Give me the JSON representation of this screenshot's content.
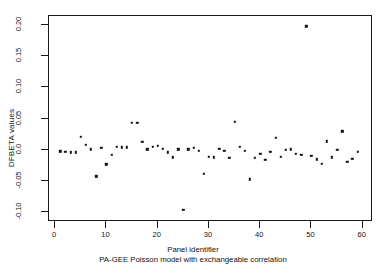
{
  "chart_data": {
    "type": "scatter",
    "title": "",
    "xlabel": "Panel identifier",
    "ylabel": "DFBETA values",
    "caption": "PA-GEE Poisson model with exchangeable correlation",
    "xlim": [
      -1.2,
      62.0
    ],
    "ylim": [
      -0.1155,
      0.2145
    ],
    "xticks": [
      0,
      10,
      20,
      30,
      40,
      50,
      60
    ],
    "xtick_labels": [
      "0",
      "10",
      "20",
      "30",
      "40",
      "50",
      "60"
    ],
    "yticks": [
      0.2,
      0.15,
      0.1,
      0.05,
      0.0,
      -0.05,
      -0.1
    ],
    "ytick_labels": [
      "0.20",
      "0.15",
      "0.10",
      "0.05",
      "0.0",
      "-0.05",
      "-0.10"
    ],
    "grid": false,
    "legend": null,
    "marker": "filled-square",
    "marker_color": "#111111",
    "x": [
      1,
      2,
      3,
      4,
      5,
      6,
      7,
      8,
      9,
      10,
      11,
      12,
      13,
      14,
      15,
      16,
      17,
      18,
      19,
      20,
      21,
      22,
      23,
      24,
      25,
      26,
      27,
      28,
      29,
      30,
      31,
      32,
      33,
      34,
      35,
      36,
      37,
      38,
      39,
      40,
      41,
      42,
      43,
      44,
      45,
      46,
      47,
      48,
      49,
      50,
      51,
      52,
      53,
      54,
      55,
      56,
      57,
      58,
      59
    ],
    "y": [
      -0.002,
      -0.003,
      -0.004,
      -0.004,
      0.021,
      0.008,
      0.001,
      -0.042,
      0.003,
      -0.023,
      -0.008,
      0.005,
      0.004,
      0.004,
      0.043,
      0.043,
      0.013,
      0.001,
      0.005,
      0.007,
      0.002,
      -0.004,
      -0.012,
      0.001,
      -0.096,
      0.001,
      0.003,
      -0.001,
      -0.038,
      -0.011,
      -0.012,
      0.002,
      -0.001,
      -0.013,
      0.045,
      0.005,
      -0.001,
      -0.047,
      -0.013,
      -0.006,
      -0.016,
      -0.003,
      0.019,
      -0.011,
      0.0,
      0.001,
      -0.006,
      -0.008,
      0.198,
      -0.009,
      -0.015,
      -0.022,
      0.014,
      -0.012,
      0.0,
      0.03,
      -0.019,
      -0.014,
      -0.003
    ]
  },
  "axis": {
    "y_title": "DFBETA values",
    "x_title": "Panel identifier",
    "sub_caption": "PA-GEE Poisson model with exchangeable correlation"
  }
}
